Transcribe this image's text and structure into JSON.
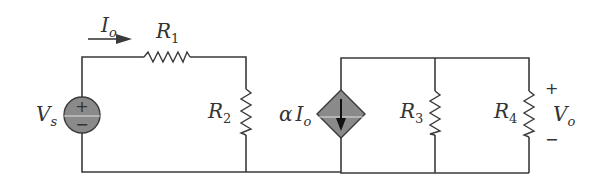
{
  "diagram": {
    "type": "circuit-schematic",
    "background_color": "#ffffff",
    "wire_color": "#3a3a3a",
    "source_fill_color": "#8a8a8a",
    "components": {
      "voltage_source": {
        "symbol": "V",
        "subscript": "s",
        "plus": "+",
        "minus": "−"
      },
      "current_label": {
        "symbol": "I",
        "subscript": "o",
        "direction": "right"
      },
      "r1": {
        "symbol": "R",
        "subscript": "1"
      },
      "r2": {
        "symbol": "R",
        "subscript": "2"
      },
      "dependent_source": {
        "coefficient": "α",
        "symbol": "I",
        "subscript": "o",
        "arrow_direction": "down"
      },
      "r3": {
        "symbol": "R",
        "subscript": "3"
      },
      "r4": {
        "symbol": "R",
        "subscript": "4"
      },
      "output_voltage": {
        "symbol": "V",
        "subscript": "o",
        "plus": "+",
        "minus": "−"
      }
    }
  }
}
